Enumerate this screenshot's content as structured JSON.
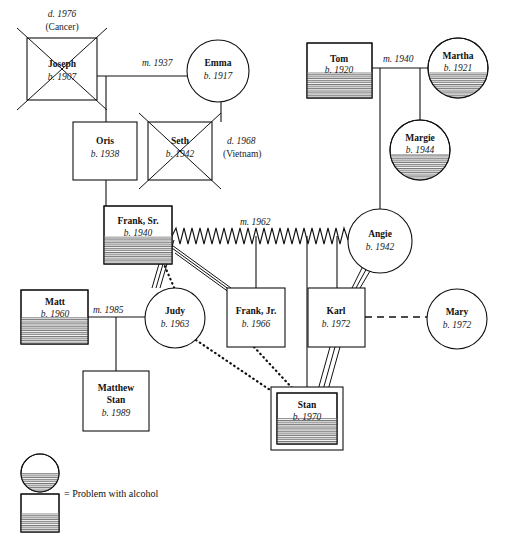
{
  "legend": {
    "label": "= Problem with alcohol",
    "female_symbol": "circle-half-hatched",
    "male_symbol": "square-half-hatched"
  },
  "people": [
    {
      "id": "joseph",
      "name": "Joseph",
      "birth": "b. 1907",
      "shape": "square",
      "deceased": true,
      "death": "d. 1976",
      "death_cause": "(Cancer)",
      "alcohol": false,
      "identified": false
    },
    {
      "id": "emma",
      "name": "Emma",
      "birth": "b. 1917",
      "shape": "circle",
      "deceased": false,
      "death": "",
      "death_cause": "",
      "alcohol": false,
      "identified": false
    },
    {
      "id": "oris",
      "name": "Oris",
      "birth": "b. 1938",
      "shape": "square",
      "deceased": false,
      "death": "",
      "death_cause": "",
      "alcohol": false,
      "identified": false
    },
    {
      "id": "seth",
      "name": "Seth",
      "birth": "b. 1942",
      "shape": "square",
      "deceased": true,
      "death": "d. 1968",
      "death_cause": "(Vietnam)",
      "alcohol": false,
      "identified": false
    },
    {
      "id": "tom",
      "name": "Tom",
      "birth": "b. 1920",
      "shape": "square",
      "deceased": false,
      "death": "",
      "death_cause": "",
      "alcohol": true,
      "identified": false
    },
    {
      "id": "martha",
      "name": "Martha",
      "birth": "b. 1921",
      "shape": "circle",
      "deceased": false,
      "death": "",
      "death_cause": "",
      "alcohol": true,
      "identified": false
    },
    {
      "id": "margie",
      "name": "Margie",
      "birth": "b. 1944",
      "shape": "circle",
      "deceased": false,
      "death": "",
      "death_cause": "",
      "alcohol": true,
      "identified": false
    },
    {
      "id": "franksr",
      "name": "Frank, Sr.",
      "birth": "b. 1940",
      "shape": "square",
      "deceased": false,
      "death": "",
      "death_cause": "",
      "alcohol": true,
      "identified": false
    },
    {
      "id": "angie",
      "name": "Angie",
      "birth": "b. 1942",
      "shape": "circle",
      "deceased": false,
      "death": "",
      "death_cause": "",
      "alcohol": false,
      "identified": false
    },
    {
      "id": "matt",
      "name": "Matt",
      "birth": "b. 1960",
      "shape": "square",
      "deceased": false,
      "death": "",
      "death_cause": "",
      "alcohol": true,
      "identified": false
    },
    {
      "id": "judy",
      "name": "Judy",
      "birth": "b. 1963",
      "shape": "circle",
      "deceased": false,
      "death": "",
      "death_cause": "",
      "alcohol": false,
      "identified": false
    },
    {
      "id": "frankjr",
      "name": "Frank, Jr.",
      "birth": "b. 1966",
      "shape": "square",
      "deceased": false,
      "death": "",
      "death_cause": "",
      "alcohol": false,
      "identified": false
    },
    {
      "id": "karl",
      "name": "Karl",
      "birth": "b. 1972",
      "shape": "square",
      "deceased": false,
      "death": "",
      "death_cause": "",
      "alcohol": false,
      "identified": false
    },
    {
      "id": "mary",
      "name": "Mary",
      "birth": "b. 1972",
      "shape": "circle",
      "deceased": false,
      "death": "",
      "death_cause": "",
      "alcohol": false,
      "identified": false
    },
    {
      "id": "matthew",
      "name": "Matthew",
      "name2": "Stan",
      "birth": "b. 1989",
      "shape": "square",
      "deceased": false,
      "death": "",
      "death_cause": "",
      "alcohol": false,
      "identified": false
    },
    {
      "id": "stan",
      "name": "Stan",
      "birth": "b. 1970",
      "shape": "square",
      "deceased": false,
      "death": "",
      "death_cause": "",
      "alcohol": true,
      "identified": true
    }
  ],
  "marriages": [
    {
      "id": "joseph-emma",
      "label": "m. 1937",
      "partners": [
        "joseph",
        "emma"
      ],
      "line": "solid"
    },
    {
      "id": "tom-martha",
      "label": "m. 1940",
      "partners": [
        "tom",
        "martha"
      ],
      "line": "solid"
    },
    {
      "id": "franksr-angie",
      "label": "m. 1962",
      "partners": [
        "franksr",
        "angie"
      ],
      "line": "zigzag-conflict"
    },
    {
      "id": "matt-judy",
      "label": "m. 1985",
      "partners": [
        "matt",
        "judy"
      ],
      "line": "solid"
    },
    {
      "id": "karl-mary",
      "label": "",
      "partners": [
        "karl",
        "mary"
      ],
      "line": "dashed"
    }
  ],
  "relationships": [
    {
      "from": "franksr",
      "to": "judy",
      "type": "fused-triple"
    },
    {
      "from": "franksr",
      "to": "frankjr",
      "type": "fused-triple"
    },
    {
      "from": "franksr",
      "to": "judy",
      "type": "distant-dotted"
    },
    {
      "from": "angie",
      "to": "karl",
      "type": "fused-triple"
    },
    {
      "from": "karl",
      "to": "stan",
      "type": "fused-triple"
    },
    {
      "from": "judy",
      "to": "stan",
      "type": "distant-dotted"
    },
    {
      "from": "frankjr",
      "to": "stan",
      "type": "distant-dotted"
    }
  ]
}
